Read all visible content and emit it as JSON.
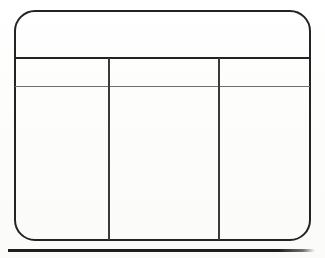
{
  "document": {
    "kind": "blank-table-form",
    "background_color": "#fdfdfb",
    "ink_color": "#232323",
    "rule_color": "#707070"
  },
  "form": {
    "title_band": {
      "label": ""
    },
    "table": {
      "column_count": 3,
      "headers": [
        "",
        "",
        ""
      ],
      "rows": [
        [
          "",
          "",
          ""
        ]
      ]
    }
  },
  "footer": {
    "separator_label": ""
  }
}
